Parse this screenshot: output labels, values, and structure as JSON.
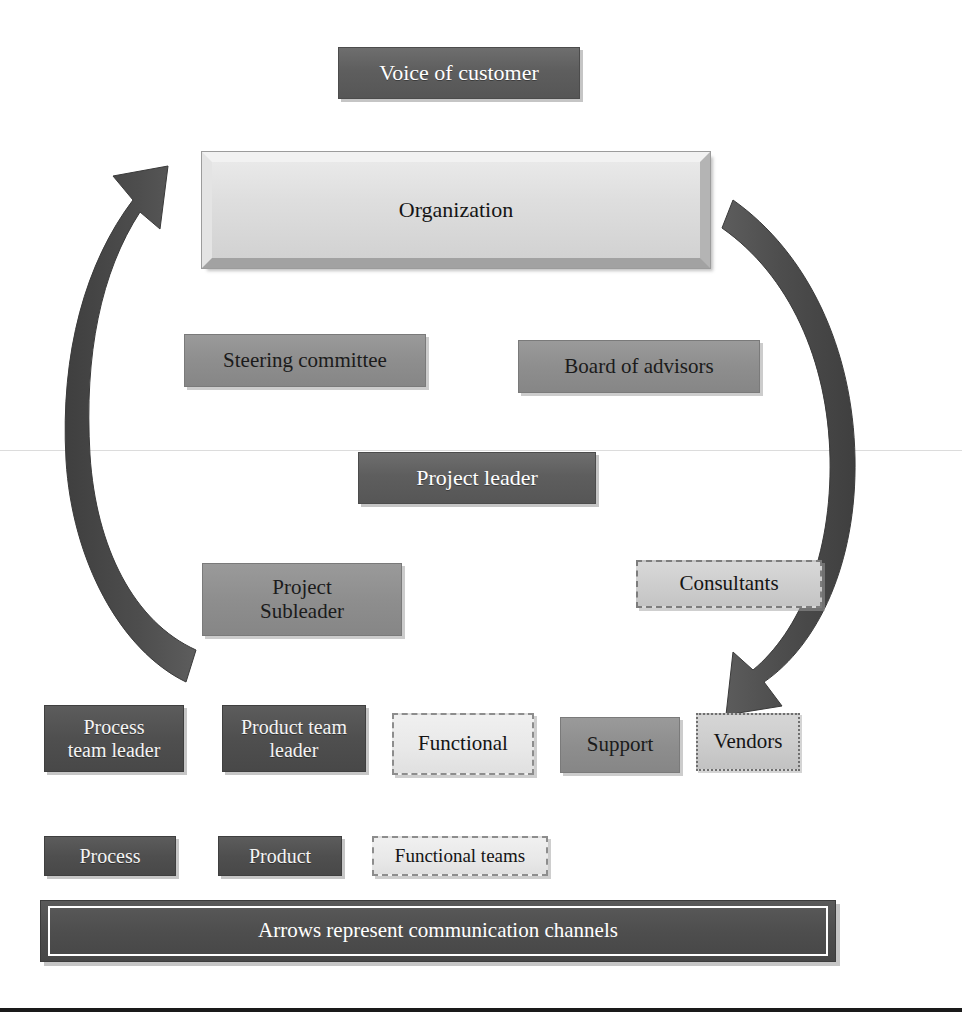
{
  "diagram": {
    "caption": "Arrows represent communication channels",
    "colors": {
      "dark_fill": "#5e5e5e",
      "darker_fill": "#4f4f4f",
      "mid_fill": "#8e8e8e",
      "bevel_fill": "#dedede",
      "light_fill": "#e8e8e8",
      "arrow_fill": "#4a4a4a",
      "page_background": "#ffffff",
      "caption_fill": "#4e4e4e"
    },
    "nodes": [
      {
        "id": "voice-of-customer",
        "label": "Voice of customer",
        "style": "dark"
      },
      {
        "id": "organization",
        "label": "Organization",
        "style": "bevel"
      },
      {
        "id": "steering-committee",
        "label": "Steering committee",
        "style": "mid"
      },
      {
        "id": "board-of-advisors",
        "label": "Board of advisors",
        "style": "mid"
      },
      {
        "id": "project-leader",
        "label": "Project leader",
        "style": "dark"
      },
      {
        "id": "project-subleader",
        "label": "Project\nSubleader",
        "style": "mid"
      },
      {
        "id": "consultants",
        "label": "Consultants",
        "style": "dashed-gray"
      },
      {
        "id": "process-team-leader",
        "label": "Process\nteam leader",
        "style": "darker"
      },
      {
        "id": "product-team-leader",
        "label": "Product team\nleader",
        "style": "darker"
      },
      {
        "id": "functional",
        "label": "Functional",
        "style": "dashed"
      },
      {
        "id": "support",
        "label": "Support",
        "style": "mid"
      },
      {
        "id": "vendors",
        "label": "Vendors",
        "style": "dotted"
      },
      {
        "id": "process",
        "label": "Process",
        "style": "darker"
      },
      {
        "id": "product",
        "label": "Product",
        "style": "darker"
      },
      {
        "id": "functional-teams",
        "label": "Functional teams",
        "style": "dashed"
      }
    ],
    "arrows": [
      {
        "id": "left-communication-arrow",
        "direction": "upward",
        "points_to": "organization"
      },
      {
        "id": "right-communication-arrow",
        "direction": "downward",
        "points_to": "consultants"
      }
    ]
  }
}
